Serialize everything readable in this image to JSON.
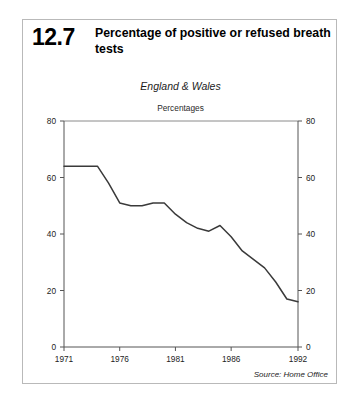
{
  "figure": {
    "number": "12.7",
    "title": "Percentage of positive or refused breath tests",
    "region": "England & Wales",
    "units": "Percentages",
    "source": "Source: Home Office"
  },
  "chart_data": {
    "type": "line",
    "title": "Percentage of positive or refused breath tests",
    "subtitle": "England & Wales",
    "ylabel": "Percentages",
    "xlabel": "",
    "source": "Source: Home Office",
    "grid": false,
    "legend": null,
    "xlim": [
      1971,
      1992
    ],
    "ylim": [
      0,
      80
    ],
    "xticks": [
      1971,
      1976,
      1981,
      1986,
      1992
    ],
    "xtick_labels": [
      "1971",
      "1976",
      "1981",
      "1986",
      "1992"
    ],
    "yticks": [
      0,
      20,
      40,
      60,
      80
    ],
    "ytick_labels": [
      "0",
      "20",
      "40",
      "60",
      "80"
    ],
    "y_axis_right": true,
    "right_ytick_labels": [
      "0",
      "20",
      "40",
      "60",
      "80"
    ],
    "x": [
      1971,
      1972,
      1973,
      1974,
      1975,
      1976,
      1977,
      1978,
      1979,
      1980,
      1981,
      1982,
      1983,
      1984,
      1985,
      1986,
      1987,
      1988,
      1989,
      1990,
      1991,
      1992
    ],
    "series": [
      {
        "name": "Percentage of positive or refused breath tests",
        "values": [
          64,
          64,
          64,
          64,
          58,
          51,
          50,
          50,
          51,
          51,
          47,
          44,
          42,
          41,
          43,
          39,
          34,
          31,
          28,
          23,
          17,
          16
        ],
        "color": "#3a3a3a"
      }
    ]
  },
  "colors": {
    "line": "#3a3a3a",
    "axis": "#555555",
    "frame": "#8a8a8a",
    "border": "#b9b9b9",
    "text": "#000000"
  }
}
